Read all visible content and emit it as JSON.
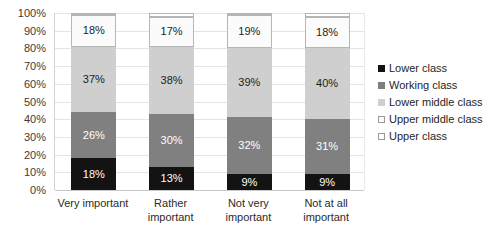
{
  "chart_data": {
    "type": "bar",
    "subtype": "stacked-100-percent-column",
    "title": "",
    "subtitle": "",
    "xlabel": "",
    "ylabel": "",
    "ylim": [
      0,
      100
    ],
    "grid": true,
    "legend_position": "right",
    "y_ticks": [
      "0%",
      "10%",
      "20%",
      "30%",
      "40%",
      "50%",
      "60%",
      "70%",
      "80%",
      "90%",
      "100%"
    ],
    "y_tick_values": [
      0,
      10,
      20,
      30,
      40,
      50,
      60,
      70,
      80,
      90,
      100
    ],
    "categories": [
      "Very important",
      "Rather important",
      "Not very important",
      "Not at all important"
    ],
    "series": [
      {
        "name": "Lower class",
        "color": "#131313",
        "values": [
          18,
          13,
          9,
          9
        ],
        "labels": [
          "18%",
          "13%",
          "9%",
          "9%"
        ]
      },
      {
        "name": "Working class",
        "color": "#808080",
        "values": [
          26,
          30,
          32,
          31
        ],
        "labels": [
          "26%",
          "30%",
          "32%",
          "31%"
        ]
      },
      {
        "name": "Lower middle class",
        "color": "#cfcfcf",
        "values": [
          37,
          38,
          39,
          40
        ],
        "labels": [
          "37%",
          "38%",
          "39%",
          "40%"
        ]
      },
      {
        "name": "Upper middle class",
        "color": "#fbfbfb",
        "values": [
          18,
          17,
          19,
          18
        ],
        "labels": [
          "18%",
          "17%",
          "19%",
          "18%"
        ]
      },
      {
        "name": "Upper class",
        "color": "#ffffff",
        "values": [
          1,
          2,
          1,
          2
        ],
        "labels": [
          "",
          "",
          "",
          ""
        ]
      }
    ]
  },
  "legend": {
    "items": [
      {
        "label": "Lower class"
      },
      {
        "label": "Working class"
      },
      {
        "label": "Lower middle class"
      },
      {
        "label": "Upper middle class"
      },
      {
        "label": "Upper class"
      }
    ]
  },
  "colors": {
    "lower_class": "#131313",
    "working_class": "#808080",
    "lower_middle_class": "#cfcfcf",
    "upper_middle_class": "#fbfbfb",
    "upper_class": "#ffffff",
    "gridline": "#e4e4e4",
    "axis": "#c9c9c9",
    "background": "#ffffff"
  }
}
